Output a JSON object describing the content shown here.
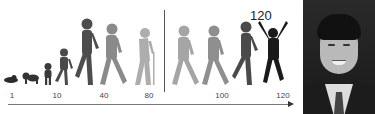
{
  "illustration": {
    "title": "Human life stages",
    "highlight_label": "120",
    "axis": {
      "ticks": [
        {
          "label": "1",
          "x": 12
        },
        {
          "label": "10",
          "x": 57
        },
        {
          "label": "40",
          "x": 104
        },
        {
          "label": "80",
          "x": 149
        },
        {
          "label": "100",
          "x": 222
        },
        {
          "label": "120",
          "x": 283
        }
      ]
    },
    "figures": [
      {
        "stage": "infant-lying",
        "color": "#2b2b2b"
      },
      {
        "stage": "baby-crawling",
        "color": "#333333"
      },
      {
        "stage": "toddler",
        "color": "#3a3a3a"
      },
      {
        "stage": "child",
        "color": "#4a4a4a"
      },
      {
        "stage": "adult",
        "color": "#4d4d4d"
      },
      {
        "stage": "middle-aged",
        "color": "#8a8a8a"
      },
      {
        "stage": "elderly-with-cane",
        "color": "#adadad"
      },
      {
        "stage": "older-walking",
        "color": "#a5a5a5"
      },
      {
        "stage": "older-walking-2",
        "color": "#8f8f8f"
      },
      {
        "stage": "rejuvenated-walking",
        "color": "#4a4a4a"
      },
      {
        "stage": "rejuvenated-jumping",
        "color": "#1a1a1a"
      }
    ]
  },
  "photo": {
    "subject": "portrait-of-man-in-suit"
  }
}
